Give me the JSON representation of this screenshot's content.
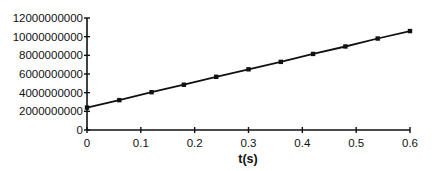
{
  "chart_data": {
    "type": "line",
    "title": "",
    "xlabel": "t(s)",
    "ylabel": "",
    "xlim": [
      0,
      0.6
    ],
    "ylim": [
      0,
      12000000000
    ],
    "x_ticks": [
      "0",
      "0.1",
      "0.2",
      "0.3",
      "0.4",
      "0.5",
      "0.6"
    ],
    "y_ticks": [
      "0",
      "2000000000",
      "4000000000",
      "6000000000",
      "8000000000",
      "10000000000",
      "12000000000"
    ],
    "grid": false,
    "legend": null,
    "marker": "square",
    "series": [
      {
        "name": "data",
        "color": "#111111",
        "x": [
          0,
          0.06,
          0.12,
          0.18,
          0.24,
          0.3,
          0.36,
          0.42,
          0.48,
          0.54,
          0.6
        ],
        "y": [
          2400000000,
          3200000000,
          4050000000,
          4850000000,
          5700000000,
          6500000000,
          7300000000,
          8150000000,
          8950000000,
          9800000000,
          10600000000
        ]
      }
    ]
  }
}
